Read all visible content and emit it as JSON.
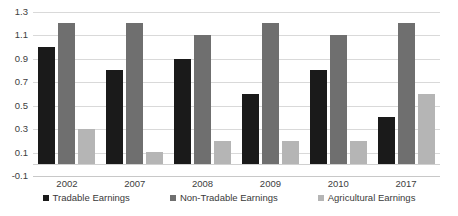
{
  "chart_data": {
    "type": "bar",
    "title": "",
    "subtitle": "",
    "xlabel": "",
    "ylabel": "",
    "categories": [
      "2002",
      "2007",
      "2008",
      "2009",
      "2010",
      "2017"
    ],
    "series": [
      {
        "name": "Tradable Earnings",
        "color": "#1a1a1a",
        "values": [
          1.0,
          0.8,
          0.9,
          0.6,
          0.8,
          0.4
        ]
      },
      {
        "name": "Non-Tradable Earnings",
        "color": "#6f6f6f",
        "values": [
          1.2,
          1.2,
          1.1,
          1.2,
          1.1,
          1.2
        ]
      },
      {
        "name": "Agricultural Earnings",
        "color": "#b5b5b5",
        "values": [
          0.3,
          0.1,
          0.2,
          0.2,
          0.2,
          0.6
        ]
      }
    ],
    "ylim": [
      -0.1,
      1.3
    ],
    "yticks": [
      "1.3",
      "1.1",
      "0.9",
      "0.7",
      "0.5",
      "0.3",
      "0.1",
      "-0.1"
    ],
    "ytick_values": [
      1.3,
      1.1,
      0.9,
      0.7,
      0.5,
      0.3,
      0.1,
      -0.1
    ],
    "grid": true,
    "legend_position": "bottom",
    "legend": [
      "Tradable Earnings",
      "Non-Tradable Earnings",
      "Agricultural Earnings"
    ]
  }
}
